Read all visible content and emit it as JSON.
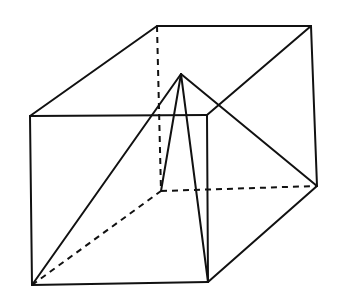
{
  "diagram": {
    "colors": {
      "line": "#111111",
      "background": "#ffffff"
    },
    "vertices": {
      "front_top_left": [
        30,
        116
      ],
      "front_top_right": [
        207,
        115
      ],
      "front_bottom_left": [
        32,
        285
      ],
      "front_bottom_right": [
        208,
        282
      ],
      "back_top_left": [
        157,
        26
      ],
      "back_top_right": [
        311,
        26
      ],
      "back_bottom_left": [
        161,
        191
      ],
      "back_bottom_right": [
        317,
        186
      ],
      "apex": [
        181,
        74
      ]
    }
  }
}
